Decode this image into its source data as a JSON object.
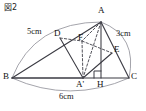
{
  "figure": {
    "caption": "図2",
    "title_alt": "Figure 2",
    "colors": {
      "stroke": "#3a3a42",
      "dashed": "#4a4a52",
      "arc": "#9a9aa2",
      "background": "#ffffff",
      "text": "#111111"
    },
    "points": [
      {
        "id": "A",
        "label": "A",
        "x": 101,
        "y": 22
      },
      {
        "id": "B",
        "label": "B",
        "x": 12,
        "y": 78
      },
      {
        "id": "C",
        "label": "C",
        "x": 129,
        "y": 78
      },
      {
        "id": "D",
        "label": "D",
        "x": 60,
        "y": 38
      },
      {
        "id": "E",
        "label": "E",
        "x": 112,
        "y": 53
      },
      {
        "id": "F",
        "label": "F",
        "x": 82,
        "y": 41
      },
      {
        "id": "Ap",
        "label": "A'",
        "x": 83,
        "y": 78
      },
      {
        "id": "H",
        "label": "H",
        "x": 101,
        "y": 78
      }
    ],
    "point_labels": [
      {
        "id": "label-A",
        "text": "A",
        "left": 98,
        "top": 6
      },
      {
        "id": "label-B",
        "text": "B",
        "left": 3,
        "top": 73
      },
      {
        "id": "label-C",
        "text": "C",
        "left": 131,
        "top": 73
      },
      {
        "id": "label-D",
        "text": "D",
        "left": 54,
        "top": 29
      },
      {
        "id": "label-E",
        "text": "E",
        "left": 114,
        "top": 45
      },
      {
        "id": "label-F",
        "text": "F",
        "left": 78,
        "top": 33
      },
      {
        "id": "label-Ap",
        "text": "A'",
        "left": 76,
        "top": 81
      },
      {
        "id": "label-H",
        "text": "H",
        "left": 97,
        "top": 81
      }
    ],
    "measurements": [
      {
        "id": "side-BA",
        "text": "5cm",
        "left": 27,
        "top": 28,
        "side": "BA"
      },
      {
        "id": "side-AC",
        "text": "3cm",
        "left": 117,
        "top": 30,
        "side": "AC"
      },
      {
        "id": "side-BC",
        "text": "6cm",
        "left": 59,
        "top": 93,
        "side": "BC"
      }
    ],
    "solid_segments": [
      {
        "id": "seg-BC",
        "from": "B",
        "to": "C"
      },
      {
        "id": "seg-BA",
        "from": "B",
        "to": "A"
      },
      {
        "id": "seg-AC",
        "from": "A",
        "to": "C"
      },
      {
        "id": "seg-AH",
        "from": "A",
        "to": "H"
      },
      {
        "id": "seg-DAp",
        "from": "D",
        "to": "Ap"
      },
      {
        "id": "seg-ApE",
        "from": "Ap",
        "to": "E"
      },
      {
        "id": "seg-AD",
        "from": "A",
        "to": "D"
      },
      {
        "id": "seg-AE",
        "from": "A",
        "to": "E"
      },
      {
        "id": "seg-BAp",
        "from": "B",
        "to": "Ap"
      }
    ],
    "dashed_segments": [
      {
        "id": "dseg-DF",
        "from": "D",
        "to": "F"
      },
      {
        "id": "dseg-FE",
        "from": "F",
        "to": "E"
      },
      {
        "id": "dseg-AF",
        "from": "A",
        "to": "F"
      },
      {
        "id": "dseg-FAp",
        "from": "F",
        "to": "Ap"
      },
      {
        "id": "dseg-AAp",
        "from": "A",
        "to": "Ap"
      }
    ],
    "arcs": [
      {
        "id": "arc-BA",
        "from": "B",
        "to": "A",
        "bulge": 13,
        "side": "outer"
      },
      {
        "id": "arc-AC",
        "from": "A",
        "to": "C",
        "bulge": 12,
        "side": "outer"
      },
      {
        "id": "arc-BC",
        "from": "B",
        "to": "C",
        "bulge": 13,
        "side": "outer"
      }
    ],
    "right_angle": {
      "id": "right-angle-H",
      "at": "H",
      "size": 7,
      "description": "right angle mark at H between AH and HC"
    }
  }
}
